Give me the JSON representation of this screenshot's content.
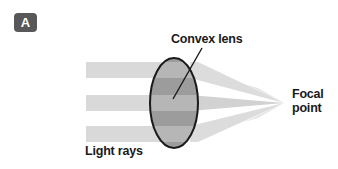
{
  "figure": {
    "panel_label": "A",
    "background_color": "#ffffff",
    "width": 338,
    "height": 169
  },
  "labels": {
    "convex_lens": "Convex lens",
    "light_rays": "Light rays",
    "focal_point_line1": "Focal",
    "focal_point_line2": "point"
  },
  "colors": {
    "badge_fill": "#58585a",
    "badge_text": "#ffffff",
    "text": "#1a1a1a",
    "ray_incoming": "#d9d9d9",
    "ray_outgoing": "#dcdcdc",
    "ray_outgoing_edge": "#cfcfcf",
    "lens_fill": "#9a9a9a",
    "lens_band_light": "#b4b4b4",
    "lens_outline": "#1a1a1a",
    "leader_line": "#1a1a1a"
  },
  "diagram": {
    "type": "optics-ray-diagram",
    "lens": {
      "shape": "ellipse",
      "center_x": 174,
      "center_y": 103,
      "radius_x": 24,
      "radius_y": 45,
      "outline_width": 2
    },
    "focal_point": {
      "x": 284,
      "y": 103
    },
    "incoming_rays": [
      {
        "name": "top-ray",
        "x_start": 86,
        "x_end": 174,
        "y_top": 62,
        "y_bottom": 78
      },
      {
        "name": "middle-ray",
        "x_start": 86,
        "x_end": 174,
        "y_top": 95,
        "y_bottom": 111
      },
      {
        "name": "bottom-ray",
        "x_start": 86,
        "x_end": 174,
        "y_top": 126,
        "y_bottom": 142
      }
    ],
    "outgoing_rays": [
      {
        "name": "top-refracted-ray",
        "from_y_top": 62,
        "from_y_bottom": 78,
        "to_x": 284,
        "to_y": 103
      },
      {
        "name": "middle-refracted-ray",
        "from_y_top": 95,
        "from_y_bottom": 111,
        "to_x": 284,
        "to_y": 103
      },
      {
        "name": "bottom-refracted-ray",
        "from_y_top": 126,
        "from_y_bottom": 142,
        "to_x": 284,
        "to_y": 103
      }
    ],
    "leader_line": {
      "name": "convex-lens-leader-line",
      "x1": 202,
      "y1": 48,
      "x2": 173,
      "y2": 99
    }
  }
}
